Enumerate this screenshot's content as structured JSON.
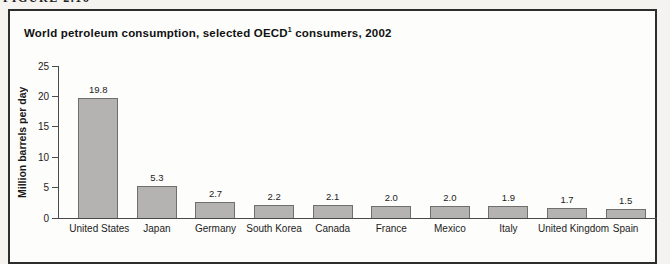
{
  "figure_label": "FIGURE 2.16",
  "chart_data": {
    "type": "bar",
    "title": "World petroleum consumption, selected OECD¹ consumers, 2002",
    "title_parts": {
      "prefix": "World petroleum consumption, selected OECD",
      "sup": "1",
      "suffix": " consumers, 2002"
    },
    "categories": [
      "United States",
      "Japan",
      "Germany",
      "South Korea",
      "Canada",
      "France",
      "Mexico",
      "Italy",
      "United Kingdom",
      "Spain"
    ],
    "values": [
      19.8,
      5.3,
      2.7,
      2.2,
      2.1,
      2.0,
      2.0,
      1.9,
      1.7,
      1.5
    ],
    "value_labels": [
      "19.8",
      "5.3",
      "2.7",
      "2.2",
      "2.1",
      "2.0",
      "2.0",
      "1.9",
      "1.7",
      "1.5"
    ],
    "xlabel": "",
    "ylabel": "Million barrels per day",
    "ylim": [
      0,
      25
    ],
    "yticks": [
      0,
      5,
      10,
      15,
      20,
      25
    ],
    "grid": false,
    "legend": false,
    "bar_color": "#b4b3b1",
    "bar_border_color": "#6f6f6d",
    "frame_border_color": "#2d2d2d",
    "background_color": "#fdfdfb"
  }
}
